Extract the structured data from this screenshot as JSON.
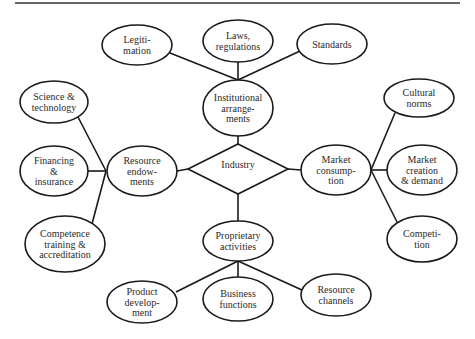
{
  "diagram": {
    "type": "concept-map",
    "center": {
      "id": "industry",
      "shape": "diamond",
      "label": [
        "Industry"
      ]
    },
    "nodes": [
      {
        "id": "institutional",
        "label": [
          "Institutional",
          "arrange-",
          "ments"
        ]
      },
      {
        "id": "resource-endowments",
        "label": [
          "Resource",
          "endow-",
          "ments"
        ]
      },
      {
        "id": "market-consumption",
        "label": [
          "Market",
          "consump-",
          "tion"
        ]
      },
      {
        "id": "proprietary",
        "label": [
          "Proprietary",
          "activities"
        ]
      },
      {
        "id": "legitimation",
        "label": [
          "Legiti-",
          "mation"
        ]
      },
      {
        "id": "laws",
        "label": [
          "Laws,",
          "regulations"
        ]
      },
      {
        "id": "standards",
        "label": [
          "Standards"
        ]
      },
      {
        "id": "science",
        "label": [
          "Science &",
          "technology"
        ]
      },
      {
        "id": "financing",
        "label": [
          "Financing",
          "&",
          "insurance"
        ]
      },
      {
        "id": "competence",
        "label": [
          "Competence",
          "training &",
          "accreditation"
        ]
      },
      {
        "id": "cultural",
        "label": [
          "Cultural",
          "norms"
        ]
      },
      {
        "id": "market-creation",
        "label": [
          "Market",
          "creation",
          "& demand"
        ]
      },
      {
        "id": "competition",
        "label": [
          "Competi-",
          "tion"
        ]
      },
      {
        "id": "product-dev",
        "label": [
          "Product",
          "develop-",
          "ment"
        ]
      },
      {
        "id": "business",
        "label": [
          "Business",
          "functions"
        ]
      },
      {
        "id": "resource-channels",
        "label": [
          "Resource",
          "channels"
        ]
      }
    ],
    "edges": [
      [
        "industry",
        "institutional"
      ],
      [
        "industry",
        "resource-endowments"
      ],
      [
        "industry",
        "market-consumption"
      ],
      [
        "industry",
        "proprietary"
      ],
      [
        "institutional",
        "legitimation"
      ],
      [
        "institutional",
        "laws"
      ],
      [
        "institutional",
        "standards"
      ],
      [
        "resource-endowments",
        "science"
      ],
      [
        "resource-endowments",
        "financing"
      ],
      [
        "resource-endowments",
        "competence"
      ],
      [
        "market-consumption",
        "cultural"
      ],
      [
        "market-consumption",
        "market-creation"
      ],
      [
        "market-consumption",
        "competition"
      ],
      [
        "proprietary",
        "product-dev"
      ],
      [
        "proprietary",
        "business"
      ],
      [
        "proprietary",
        "resource-channels"
      ]
    ]
  }
}
